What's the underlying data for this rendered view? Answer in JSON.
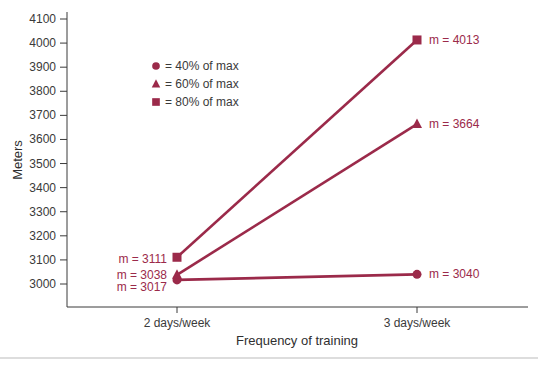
{
  "chart_data": {
    "type": "line",
    "title": "",
    "xlabel": "Frequency of training",
    "ylabel": "Meters",
    "categories": [
      "2 days/week",
      "3 days/week"
    ],
    "ylim": [
      3000,
      4100
    ],
    "yticks": [
      3000,
      3100,
      3200,
      3300,
      3400,
      3500,
      3600,
      3700,
      3800,
      3900,
      4000,
      4100
    ],
    "grid": false,
    "legend_position": "upper-left inside",
    "series": [
      {
        "name": "40% of max",
        "marker": "circle",
        "values": [
          3017,
          3040
        ],
        "labels": [
          "m = 3017",
          "m = 3040"
        ]
      },
      {
        "name": "60% of max",
        "marker": "triangle",
        "values": [
          3038,
          3664
        ],
        "labels": [
          "m = 3038",
          "m = 3664"
        ]
      },
      {
        "name": "80% of max",
        "marker": "square",
        "values": [
          3111,
          4013
        ],
        "labels": [
          "m = 3111",
          "m = 4013"
        ]
      }
    ],
    "colors": {
      "series": "#9b2a4a",
      "axis": "#3a3a3a",
      "text": "#3a3a3a"
    }
  },
  "legend": [
    {
      "marker": "circle",
      "label": "= 40% of max"
    },
    {
      "marker": "triangle",
      "label": "= 60% of max"
    },
    {
      "marker": "square",
      "label": "= 80% of max"
    }
  ]
}
